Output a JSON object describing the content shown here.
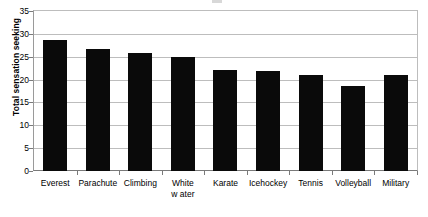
{
  "figure": {
    "title_sliver": "",
    "background_color": "#ffffff",
    "bar_color": "#0a0a0a",
    "grid_color": "#bdbdbd",
    "axis_color": "#7a7a7a"
  },
  "chart_data": {
    "type": "bar",
    "title": "",
    "xlabel": "",
    "ylabel": "Total sensation seeking",
    "categories": [
      "Everest",
      "Parachute",
      "Climbing",
      "White water",
      "Karate",
      "Icehockey",
      "Tennis",
      "Volleyball",
      "Military"
    ],
    "category_lines": [
      [
        "Everest"
      ],
      [
        "Parachute"
      ],
      [
        "Climbing"
      ],
      [
        "White",
        "w ater"
      ],
      [
        "Karate"
      ],
      [
        "Icehockey"
      ],
      [
        "Tennis"
      ],
      [
        "Volleyball"
      ],
      [
        "Military"
      ]
    ],
    "values": [
      28.7,
      26.7,
      25.8,
      24.9,
      22.2,
      21.9,
      21.0,
      18.7,
      21.0
    ],
    "ylim": [
      0,
      35
    ],
    "yticks": [
      0,
      5,
      10,
      15,
      20,
      25,
      30,
      35
    ],
    "ytick_labels": [
      "0",
      "5",
      "10",
      "15",
      "20",
      "25",
      "30",
      "35"
    ],
    "grid": true,
    "legend": false,
    "legend_position": "none"
  }
}
